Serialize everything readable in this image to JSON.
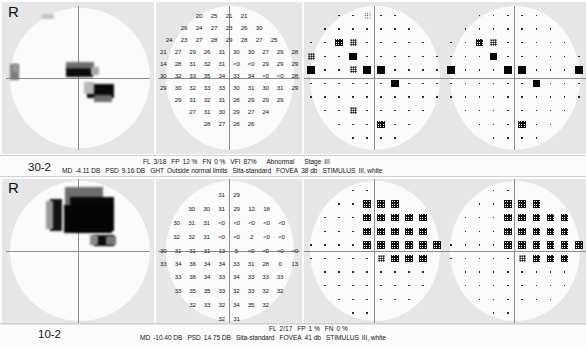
{
  "report": {
    "title": "Humphrey Visual Field Printout",
    "panels": [
      {
        "id": "panel-30-2",
        "eye": "R",
        "test_name": "30-2",
        "stats": {
          "md_label": "MD",
          "md_value": "-4.11 DB",
          "psd_label": "PSD",
          "psd_value": "9.16 DB",
          "ght_label": "GHT",
          "ght_value": "Outside normal limits",
          "fl_label": "FL",
          "fl_value": "3/18",
          "fp_label": "FP",
          "fp_value": "12 %",
          "fn_label": "FN",
          "fn_value": "0 %",
          "vfi_label": "VFI",
          "vfi_value": "87%",
          "status": "Abnormal",
          "stage_label": "Stage",
          "stage_value": "III",
          "strategy": "Sita-standard",
          "fovea_label": "FOVEA",
          "fovea_value": "38 db",
          "stimulus_label": "STIMULUS",
          "stimulus_value": "III, white"
        },
        "numeric_grid": [
          {
            "top": 10,
            "left": [],
            "right": [],
            "cells": [
              "",
              "",
              "20",
              "25",
              "21",
              "21",
              "",
              "",
              ""
            ]
          },
          {
            "top": 22,
            "cells": [
              "",
              "26",
              "24",
              "27",
              "23",
              "26",
              "30",
              "",
              ""
            ]
          },
          {
            "top": 34,
            "cells": [
              "24",
              "23",
              "27",
              "28",
              "29",
              "28",
              "27",
              "25",
              ""
            ]
          },
          {
            "top": 46,
            "cells": [
              "21",
              "27",
              "29",
              "26",
              "31",
              "30",
              "30",
              "27",
              "29",
              "28"
            ]
          },
          {
            "top": 58,
            "cells": [
              "14",
              "28",
              "31",
              "32",
              "31",
              "<0",
              "<0",
              "29",
              "29",
              "29"
            ]
          },
          {
            "top": 70,
            "cells": [
              "30",
              "32",
              "33",
              "35",
              "34",
              "33",
              "34",
              "<0",
              "<0",
              "28"
            ]
          },
          {
            "top": 82,
            "cells": [
              "29",
              "30",
              "32",
              "33",
              "33",
              "30",
              "31",
              "30",
              "31",
              "29"
            ]
          },
          {
            "top": 94,
            "cells": [
              "",
              "29",
              "31",
              "32",
              "31",
              "28",
              "29",
              "29",
              "29",
              ""
            ]
          },
          {
            "top": 106,
            "cells": [
              "",
              "",
              "27",
              "31",
              "30",
              "29",
              "27",
              "24",
              "",
              ""
            ]
          },
          {
            "top": 118,
            "cells": [
              "",
              "",
              "",
              "28",
              "27",
              "28",
              "26",
              "",
              "",
              ""
            ]
          }
        ],
        "grayscale_blobs": [
          {
            "left": 8,
            "top": 62,
            "w": 9,
            "h": 16,
            "color": "#7c7c7c"
          },
          {
            "left": 11,
            "top": 62,
            "w": 5,
            "h": 8,
            "color": "#9a9a9a"
          },
          {
            "left": 64,
            "top": 60,
            "w": 28,
            "h": 7,
            "color": "#6f6f6f"
          },
          {
            "left": 64,
            "top": 66,
            "w": 27,
            "h": 9,
            "color": "#0b0b0b"
          },
          {
            "left": 89,
            "top": 65,
            "w": 8,
            "h": 8,
            "color": "#a9a9a9"
          },
          {
            "left": 85,
            "top": 82,
            "w": 27,
            "h": 14,
            "color": "#090909"
          },
          {
            "left": 82,
            "top": 80,
            "w": 10,
            "h": 12,
            "color": "#b8b8b8"
          },
          {
            "left": 92,
            "top": 93,
            "w": 18,
            "h": 7,
            "color": "#6c6c6c"
          },
          {
            "left": 40,
            "top": 12,
            "w": 12,
            "h": 5,
            "color": "#c3c3c3"
          }
        ],
        "total_dev_symbols": [
          [
            "",
            "",
            "dot",
            "dot",
            "p5",
            "dot",
            "dot",
            "",
            "",
            ""
          ],
          [
            "",
            "dot",
            "dot",
            "dot",
            "dot",
            "dot",
            "dot",
            "dot",
            "",
            ""
          ],
          [
            "dot",
            "dot",
            "p1",
            "p2",
            "dot",
            "dot",
            "dot",
            "dot",
            "dot",
            ""
          ],
          [
            "p2",
            "dot",
            "dot",
            "p05",
            "dot",
            "dot",
            "dot",
            "dot",
            "dot",
            "dot"
          ],
          [
            "p05",
            "dot",
            "dot",
            "p2",
            "p05",
            "p05",
            "dot",
            "dot",
            "dot",
            "dot"
          ],
          [
            "dot",
            "dot",
            "dot",
            "dot",
            "dot",
            "dot",
            "p05",
            "dot",
            "dot",
            "dot"
          ],
          [
            "dot",
            "dot",
            "dot",
            "dot",
            "dot",
            "dot",
            "dot",
            "dot",
            "dot",
            "dot"
          ],
          [
            "",
            "dot",
            "dot",
            "p2",
            "dot",
            "dot",
            "dot",
            "dot",
            "dot",
            ""
          ],
          [
            "",
            "",
            "dot",
            "dot",
            "dot",
            "p1",
            "dot",
            "dot",
            "",
            ""
          ],
          [
            "",
            "",
            "",
            "dot",
            "dot",
            "dot",
            "dot",
            "",
            "",
            ""
          ]
        ],
        "pattern_dev_symbols": [
          [
            "",
            "",
            "dot",
            "dot",
            "dot",
            "dot",
            "dot",
            "",
            "",
            ""
          ],
          [
            "",
            "dot",
            "dot",
            "dot",
            "dot",
            "dot",
            "dot",
            "dot",
            "",
            ""
          ],
          [
            "dot",
            "dot",
            "p1",
            "p2",
            "dot",
            "dot",
            "dot",
            "dot",
            "dot",
            ""
          ],
          [
            "dot",
            "dot",
            "dot",
            "p05",
            "dot",
            "dot",
            "dot",
            "dot",
            "dot",
            "dot"
          ],
          [
            "p05",
            "dot",
            "dot",
            "dot",
            "p05",
            "p05",
            "dot",
            "dot",
            "dot",
            "p05"
          ],
          [
            "dot",
            "dot",
            "dot",
            "dot",
            "dot",
            "dot",
            "p05",
            "dot",
            "dot",
            "dot"
          ],
          [
            "dot",
            "dot",
            "dot",
            "dot",
            "dot",
            "dot",
            "dot",
            "dot",
            "dot",
            "dot"
          ],
          [
            "",
            "dot",
            "dot",
            "dot",
            "dot",
            "dot",
            "dot",
            "dot",
            "dot",
            ""
          ],
          [
            "",
            "",
            "dot",
            "dot",
            "dot",
            "p1",
            "dot",
            "dot",
            "",
            ""
          ],
          [
            "",
            "",
            "",
            "dot",
            "dot",
            "dot",
            "dot",
            "",
            "",
            ""
          ]
        ]
      },
      {
        "id": "panel-10-2",
        "eye": "R",
        "test_name": "10-2",
        "stats": {
          "md_label": "MD",
          "md_value": "-10.40 DB",
          "psd_label": "PSD",
          "psd_value": "14.75 DB",
          "fl_label": "FL",
          "fl_value": "2/17",
          "fp_label": "FP",
          "fp_value": "1 %",
          "fn_label": "FN",
          "fn_value": "0 %",
          "strategy": "Sita-standard",
          "fovea_label": "FOVEA",
          "fovea_value": "41 db",
          "stimulus_label": "STIMULUS",
          "stimulus_value": "III, white"
        },
        "numeric_grid": [
          {
            "top": 12,
            "cells": [
              "",
              "",
              "",
              "31",
              "29",
              "",
              "",
              ""
            ]
          },
          {
            "top": 26,
            "cells": [
              "",
              "30",
              "30",
              "31",
              "29",
              "12",
              "18",
              ""
            ]
          },
          {
            "top": 40,
            "cells": [
              "30",
              "31",
              "31",
              "<0",
              "<0",
              "<0",
              "<0",
              "<0"
            ]
          },
          {
            "top": 54,
            "cells": [
              "32",
              "32",
              "31",
              "<0",
              "<0",
              "2",
              "<0",
              "<0"
            ]
          },
          {
            "top": 68,
            "cells": [
              "30",
              "31",
              "31",
              "31",
              "13",
              "5",
              "<0",
              "<0",
              "<0",
              "<0"
            ]
          },
          {
            "top": 81,
            "cells": [
              "33",
              "34",
              "36",
              "34",
              "34",
              "33",
              "31",
              "28",
              "0",
              "13"
            ]
          },
          {
            "top": 94,
            "cells": [
              "",
              "33",
              "38",
              "34",
              "33",
              "34",
              "33",
              "33",
              "33",
              ""
            ]
          },
          {
            "top": 108,
            "cells": [
              "",
              "33",
              "35",
              "35",
              "33",
              "32",
              "33",
              "32",
              "32",
              ""
            ]
          },
          {
            "top": 122,
            "cells": [
              "",
              "",
              "32",
              "33",
              "32",
              "34",
              "35",
              "32",
              "",
              ""
            ]
          },
          {
            "top": 136,
            "cells": [
              "",
              "",
              "",
              "32",
              "31",
              "",
              "",
              ""
            ]
          }
        ],
        "grayscale_blobs": [
          {
            "left": 63,
            "top": 8,
            "w": 38,
            "h": 22,
            "color": "#6d6d6d"
          },
          {
            "left": 68,
            "top": 18,
            "w": 44,
            "h": 34,
            "color": "#070707"
          },
          {
            "left": 48,
            "top": 20,
            "w": 12,
            "h": 32,
            "color": "#121212"
          },
          {
            "left": 44,
            "top": 22,
            "w": 7,
            "h": 28,
            "color": "#9a9a9a"
          },
          {
            "left": 62,
            "top": 26,
            "w": 48,
            "h": 28,
            "color": "#050505"
          },
          {
            "left": 92,
            "top": 56,
            "w": 20,
            "h": 11,
            "color": "#0a0a0a"
          },
          {
            "left": 88,
            "top": 56,
            "w": 8,
            "h": 10,
            "color": "#8a8a8a"
          },
          {
            "left": 104,
            "top": 57,
            "w": 10,
            "h": 9,
            "color": "#7a7a7a"
          }
        ],
        "total_dev_symbols": [
          [
            "",
            "",
            "",
            "dot",
            "dot",
            "",
            "",
            "",
            "",
            ""
          ],
          [
            "",
            "",
            "dot",
            "dot",
            "p1",
            "p1",
            "p1",
            "",
            "",
            ""
          ],
          [
            "",
            "dot",
            "dot",
            "dot",
            "p1",
            "p1",
            "p1",
            "p1",
            "p1",
            ""
          ],
          [
            "",
            "dot",
            "dot",
            "dot",
            "p1",
            "p1",
            "p1",
            "p1",
            "p1",
            ""
          ],
          [
            "dot",
            "dot",
            "dot",
            "dot",
            "p1",
            "p1",
            "p1",
            "p1",
            "p1",
            "p1"
          ],
          [
            "dot",
            "dot",
            "dot",
            "dot",
            "dot",
            "p2",
            "p1",
            "p1",
            "p1",
            ""
          ],
          [
            "",
            "dot",
            "dot",
            "dot",
            "dot",
            "dot",
            "dot",
            "dot",
            "dot",
            ""
          ],
          [
            "",
            "dot",
            "dot",
            "dot",
            "dot",
            "dot",
            "dot",
            "dot",
            "dot",
            ""
          ],
          [
            "",
            "",
            "dot",
            "dot",
            "dot",
            "dot",
            "dot",
            "dot",
            "",
            ""
          ],
          [
            "",
            "",
            "",
            "dot",
            "dot",
            "",
            "",
            "",
            "",
            ""
          ]
        ],
        "pattern_dev_symbols": [
          [
            "",
            "",
            "",
            "dot",
            "dot",
            "",
            "",
            "",
            "",
            ""
          ],
          [
            "",
            "",
            "dot",
            "dot",
            "p1",
            "p1",
            "p1",
            "",
            "",
            ""
          ],
          [
            "",
            "dot",
            "dot",
            "dot",
            "p1",
            "p1",
            "p1",
            "p1",
            "p1",
            ""
          ],
          [
            "",
            "dot",
            "dot",
            "dot",
            "p1",
            "p1",
            "p1",
            "p1",
            "p1",
            ""
          ],
          [
            "dot",
            "dot",
            "dot",
            "dot",
            "p1",
            "p1",
            "p1",
            "p1",
            "p1",
            "p1"
          ],
          [
            "dot",
            "dot",
            "dot",
            "dot",
            "dot",
            "p2",
            "p1",
            "p1",
            "p1",
            ""
          ],
          [
            "",
            "dot",
            "dot",
            "dot",
            "dot",
            "dot",
            "dot",
            "dot",
            "dot",
            ""
          ],
          [
            "",
            "dot",
            "dot",
            "dot",
            "dot",
            "dot",
            "dot",
            "dot",
            "dot",
            ""
          ],
          [
            "",
            "",
            "dot",
            "dot",
            "dot",
            "dot",
            "dot",
            "dot",
            "",
            ""
          ],
          [
            "",
            "",
            "",
            "dot",
            "dot",
            "",
            "",
            "",
            "",
            ""
          ]
        ]
      }
    ]
  }
}
